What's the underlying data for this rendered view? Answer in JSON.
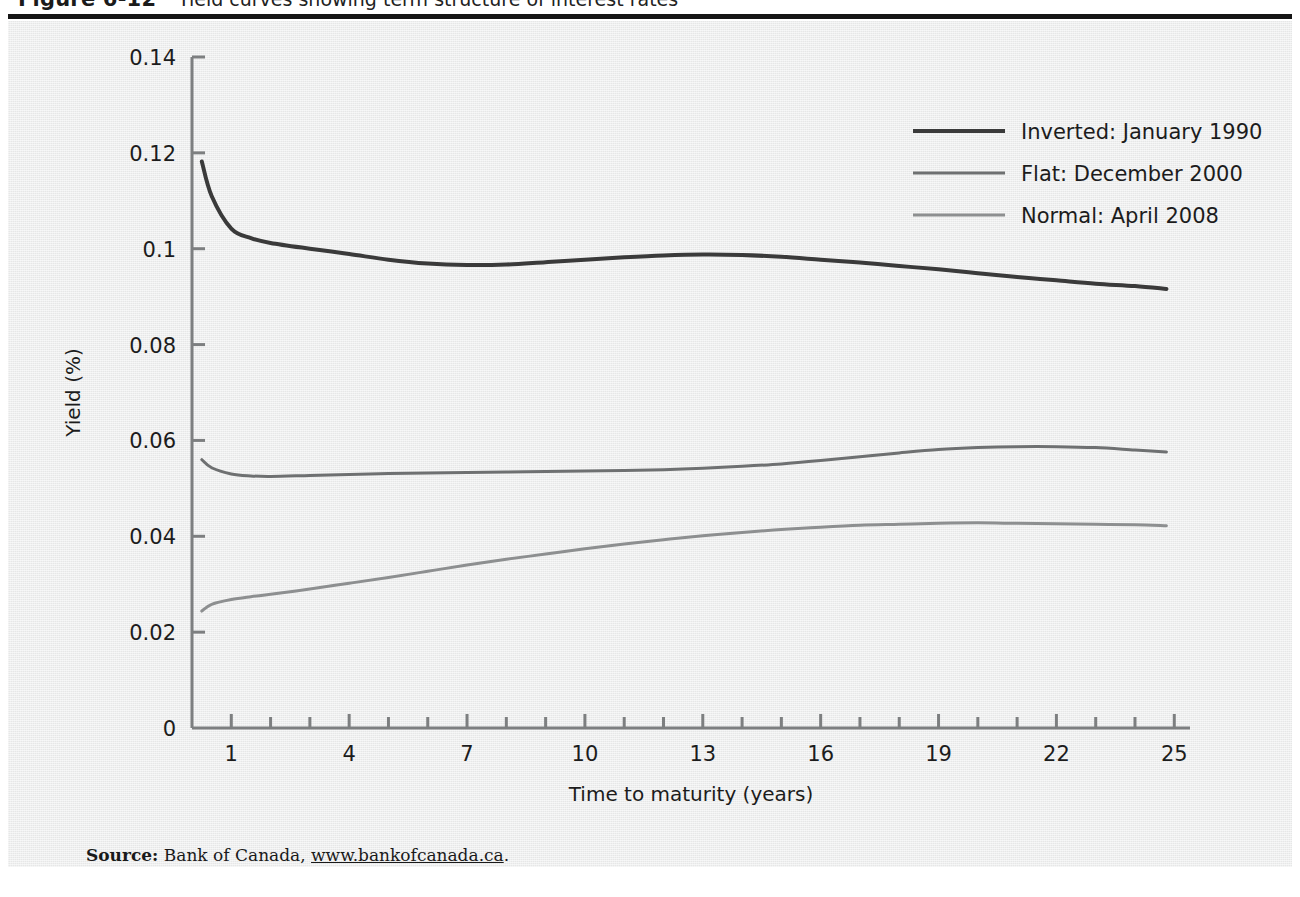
{
  "figure": {
    "number": "Figure 6-12",
    "title": "Yield curves showing term structure of interest rates"
  },
  "source": {
    "label": "Source:",
    "text": " Bank of Canada, ",
    "url": "www.bankofcanada.ca",
    "period": "."
  },
  "colors": {
    "panel_background": "#eceded",
    "axis": "#7d7f80",
    "rule": "#151515",
    "series_inverted": "#3a3a3a",
    "series_flat": "#6e7071",
    "series_normal": "#8d8f90",
    "text": "#1c1c1c"
  },
  "chart_data": {
    "type": "line",
    "title": "Yield curves showing term structure of interest rates",
    "xlabel": "Time to maturity (years)",
    "ylabel": "Yield (%)",
    "xlim": [
      0,
      25.4
    ],
    "ylim": [
      0,
      0.14
    ],
    "xticks_major": [
      1,
      4,
      7,
      10,
      13,
      16,
      19,
      22,
      25
    ],
    "xticks_minor": [
      2,
      3,
      5,
      6,
      8,
      9,
      11,
      12,
      14,
      15,
      17,
      18,
      20,
      21,
      23,
      24
    ],
    "xtick_labels": [
      "1",
      "4",
      "7",
      "10",
      "13",
      "16",
      "19",
      "22",
      "25"
    ],
    "yticks": [
      0,
      0.02,
      0.04,
      0.06,
      0.08,
      0.1,
      0.12,
      0.14
    ],
    "ytick_labels": [
      "0",
      "0.02",
      "0.04",
      "0.06",
      "0.08",
      "0.1",
      "0.12",
      "0.14"
    ],
    "grid": false,
    "legend_position": "top-right",
    "x": [
      0.25,
      0.5,
      1,
      1.5,
      2,
      3,
      4,
      5,
      6,
      7,
      8,
      9,
      10,
      11,
      12,
      13,
      14,
      15,
      16,
      17,
      18,
      19,
      20,
      21,
      22,
      23,
      24,
      24.8
    ],
    "series": [
      {
        "name": "Inverted: January 1990",
        "color": "#3a3a3a",
        "line_width": 4,
        "values": [
          0.1182,
          0.111,
          0.1042,
          0.1022,
          0.1012,
          0.1,
          0.0989,
          0.0977,
          0.0969,
          0.0966,
          0.0967,
          0.0972,
          0.0977,
          0.0982,
          0.0986,
          0.0988,
          0.0987,
          0.0983,
          0.0977,
          0.0971,
          0.0964,
          0.0957,
          0.0949,
          0.0941,
          0.0934,
          0.0927,
          0.0922,
          0.0916
        ]
      },
      {
        "name": "Flat: December 2000",
        "color": "#6e7071",
        "line_width": 3,
        "values": [
          0.056,
          0.0543,
          0.053,
          0.0526,
          0.0525,
          0.0527,
          0.0529,
          0.0531,
          0.0532,
          0.0533,
          0.0534,
          0.0535,
          0.0536,
          0.0537,
          0.0539,
          0.0542,
          0.0546,
          0.0551,
          0.0558,
          0.0566,
          0.0574,
          0.0581,
          0.0585,
          0.0587,
          0.0587,
          0.0585,
          0.058,
          0.0576
        ]
      },
      {
        "name": "Normal: April 2008",
        "color": "#8d8f90",
        "line_width": 3,
        "values": [
          0.0244,
          0.0258,
          0.0268,
          0.0274,
          0.0279,
          0.029,
          0.0302,
          0.0314,
          0.0327,
          0.034,
          0.0352,
          0.0363,
          0.0374,
          0.0384,
          0.0393,
          0.0401,
          0.0408,
          0.0414,
          0.0419,
          0.0423,
          0.0425,
          0.0427,
          0.0428,
          0.0427,
          0.0426,
          0.0425,
          0.0424,
          0.0422
        ]
      }
    ]
  }
}
